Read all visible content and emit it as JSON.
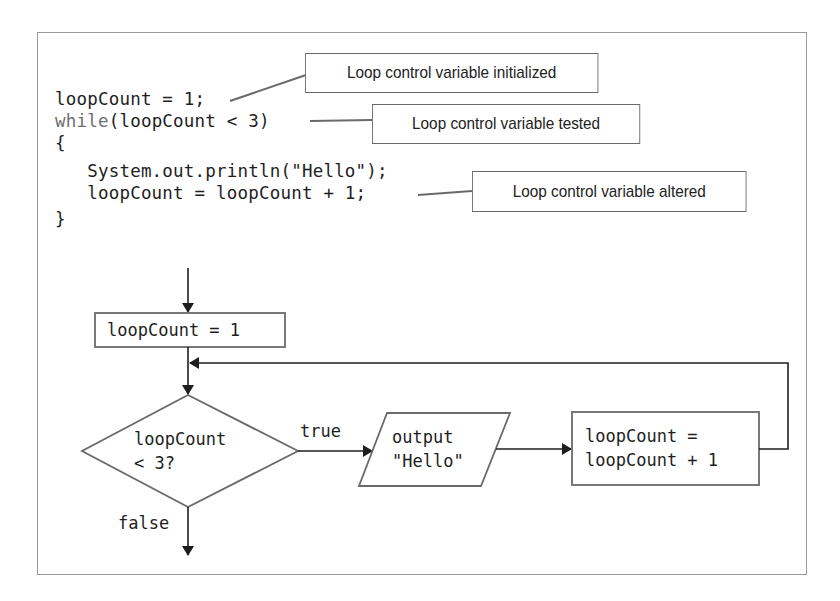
{
  "code": {
    "lines": [
      {
        "text": "loopCount = 1;"
      },
      {
        "keyword": "while",
        "text": "(loopCount < 3)"
      },
      {
        "text": "{"
      },
      {
        "text": "   System.out.println(\"Hello\");"
      },
      {
        "text": "   loopCount = loopCount + 1;"
      },
      {
        "text": "}"
      }
    ]
  },
  "callouts": {
    "initialized": "Loop control variable initialized",
    "tested": "Loop control variable tested",
    "altered": "Loop control variable altered"
  },
  "flowchart": {
    "init_box": "loopCount = 1",
    "decision": {
      "line1": "loopCount",
      "line2": "< 3?"
    },
    "true_label": "true",
    "false_label": "false",
    "output": {
      "line1": "output",
      "line2": "\"Hello\""
    },
    "increment": {
      "line1": "loopCount =",
      "line2": "loopCount + 1"
    }
  },
  "colors": {
    "keyword": "#6e6e6e",
    "text": "#1e1e1e",
    "stroke": "#6a6a6a",
    "arrow": "#1e1e1e",
    "frame": "#9a9a9a"
  }
}
